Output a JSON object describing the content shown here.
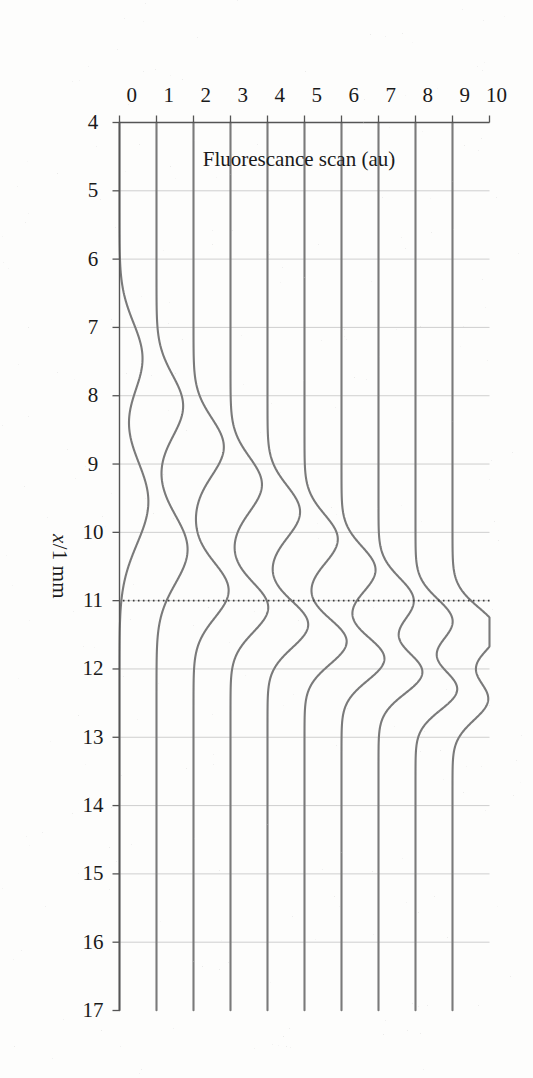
{
  "figure": {
    "kind": "waterfall-line-plot",
    "orientation_note": "printed rotated 90 degrees clockwise on the scanned page",
    "line_color": "#7a7a7a",
    "axis_color": "#555555",
    "grid_color": "#c9c9c9",
    "reference_line_color": "#3a3a3a"
  },
  "chart_data": {
    "type": "line",
    "title": "",
    "subtitle": "",
    "xlabel": "x/1 mm",
    "ylabel": "Fluorescance scan (au)",
    "xlim": [
      4,
      17
    ],
    "ylim": [
      0,
      10
    ],
    "xticks": [
      4,
      5,
      6,
      7,
      8,
      9,
      10,
      11,
      12,
      13,
      14,
      15,
      16,
      17
    ],
    "yticks": [
      0,
      1,
      2,
      3,
      4,
      5,
      6,
      7,
      8,
      9,
      10
    ],
    "xtick_labels": [
      "4",
      "5",
      "6",
      "7",
      "8",
      "9",
      "10",
      "11",
      "12",
      "13",
      "14",
      "15",
      "16",
      "17"
    ],
    "ytick_labels": [
      "0",
      "1",
      "2",
      "3",
      "4",
      "5",
      "6",
      "7",
      "8",
      "9",
      "10"
    ],
    "grid": "vertical-only",
    "legend": "none",
    "annotations": [
      {
        "name": "reference-line",
        "style": "dotted",
        "orientation": "vertical",
        "x": 11,
        "label": ""
      }
    ],
    "series_note": "Ten stacked fluorescence scan traces, each offset by +1 au. Peak position migrates from about x=7.5 on the lowest trace to about x=12.4 on the highest.",
    "series": [
      {
        "name": "scan 0",
        "baseline": 0,
        "peaks": [
          {
            "center": 7.45,
            "height": 0.62,
            "width": 0.52
          },
          {
            "center": 9.55,
            "height": 0.78,
            "width": 0.62
          }
        ]
      },
      {
        "name": "scan 1",
        "baseline": 1,
        "peaks": [
          {
            "center": 8.15,
            "height": 0.72,
            "width": 0.45
          },
          {
            "center": 10.25,
            "height": 0.84,
            "width": 0.5
          }
        ]
      },
      {
        "name": "scan 2",
        "baseline": 2,
        "peaks": [
          {
            "center": 8.75,
            "height": 0.82,
            "width": 0.42
          },
          {
            "center": 10.85,
            "height": 0.95,
            "width": 0.4
          }
        ]
      },
      {
        "name": "scan 3",
        "baseline": 3,
        "peaks": [
          {
            "center": 9.3,
            "height": 0.85,
            "width": 0.4
          },
          {
            "center": 11.1,
            "height": 1.02,
            "width": 0.36
          }
        ]
      },
      {
        "name": "scan 4",
        "baseline": 4,
        "peaks": [
          {
            "center": 9.7,
            "height": 0.88,
            "width": 0.38
          },
          {
            "center": 11.35,
            "height": 1.1,
            "width": 0.34
          }
        ]
      },
      {
        "name": "scan 5",
        "baseline": 5,
        "peaks": [
          {
            "center": 10.1,
            "height": 0.9,
            "width": 0.36
          },
          {
            "center": 11.6,
            "height": 1.14,
            "width": 0.33
          }
        ]
      },
      {
        "name": "scan 6",
        "baseline": 6,
        "peaks": [
          {
            "center": 10.55,
            "height": 0.92,
            "width": 0.34
          },
          {
            "center": 11.85,
            "height": 1.16,
            "width": 0.32
          }
        ]
      },
      {
        "name": "scan 7",
        "baseline": 7,
        "peaks": [
          {
            "center": 11.0,
            "height": 0.95,
            "width": 0.33
          },
          {
            "center": 12.05,
            "height": 1.18,
            "width": 0.31
          }
        ]
      },
      {
        "name": "scan 8",
        "baseline": 8,
        "peaks": [
          {
            "center": 11.3,
            "height": 1.0,
            "width": 0.32
          },
          {
            "center": 12.3,
            "height": 1.12,
            "width": 0.3
          }
        ]
      },
      {
        "name": "scan 9",
        "baseline": 9,
        "peaks": [
          {
            "center": 11.45,
            "height": 1.2,
            "width": 0.34
          },
          {
            "center": 12.45,
            "height": 0.95,
            "width": 0.3
          }
        ]
      }
    ]
  }
}
